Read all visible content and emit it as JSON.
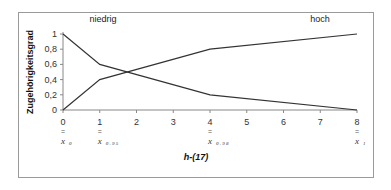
{
  "chart_data": {
    "type": "line",
    "title": "",
    "xlabel": "h-(17)",
    "ylabel": "Zugehörigkeitsgrad",
    "xlim": [
      0,
      8
    ],
    "ylim": [
      0,
      1
    ],
    "x_ticks": [
      "0",
      "1",
      "2",
      "3",
      "4",
      "5",
      "6",
      "7",
      "8"
    ],
    "y_ticks": [
      "0",
      "0,2",
      "0,4",
      "0,6",
      "0,8",
      "1"
    ],
    "grid": false,
    "series": [
      {
        "name": "niedrig",
        "x": [
          0,
          1,
          4,
          8
        ],
        "values": [
          1,
          0.6,
          0.2,
          0
        ]
      },
      {
        "name": "hoch",
        "x": [
          0,
          1,
          4,
          8
        ],
        "values": [
          0,
          0.4,
          0.8,
          1
        ]
      }
    ],
    "annotations": [
      {
        "at_x": 0,
        "symbol": "x",
        "subscript": "0"
      },
      {
        "at_x": 1,
        "symbol": "x",
        "subscript": "0 . 9 5"
      },
      {
        "at_x": 4,
        "symbol": "x",
        "subscript": "0 . 9 8"
      },
      {
        "at_x": 8,
        "symbol": "x",
        "subscript": "1"
      }
    ],
    "annotation_eq_sign": "="
  }
}
